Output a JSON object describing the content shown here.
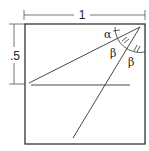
{
  "diagram": {
    "type": "geometry-figure",
    "shape": "unit square",
    "dimensions": {
      "width_label": "1",
      "height_label": ".5"
    },
    "angle_labels": {
      "alpha": "α",
      "beta_1": "β",
      "beta_2": "β"
    },
    "colors": {
      "stroke": "#333333",
      "background": "#ffffff"
    }
  }
}
